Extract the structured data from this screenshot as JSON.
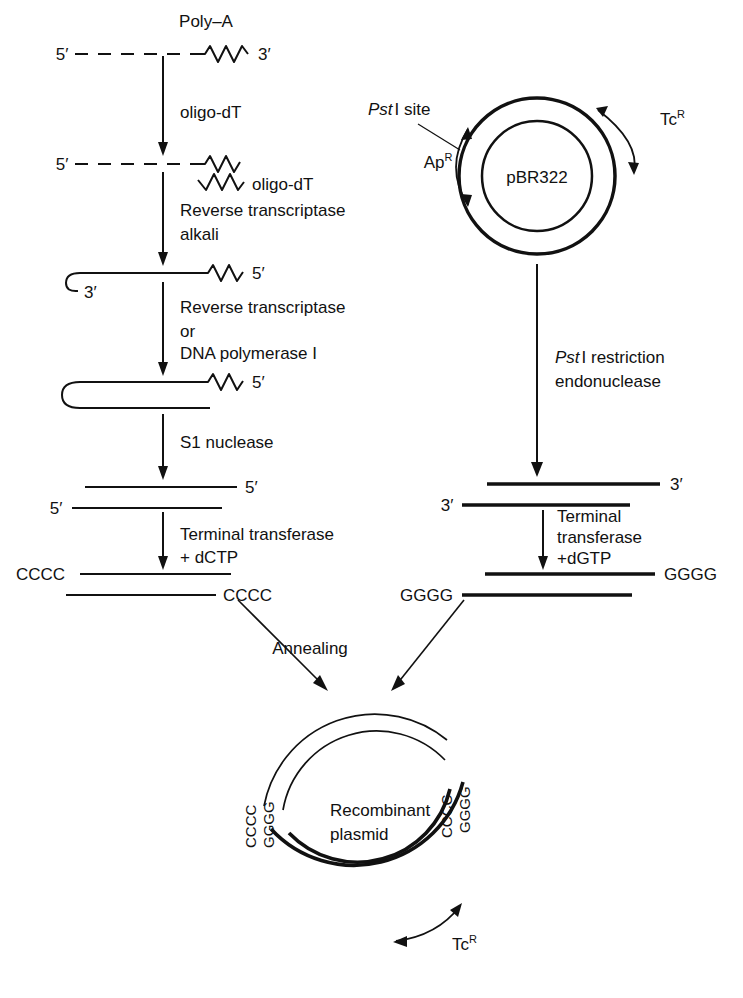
{
  "diagram": {
    "line_color": "#111111"
  },
  "left_pathway": {
    "name": "cDNA synthesis from mRNA",
    "step0": {
      "polya_label": "Poly–A",
      "five_prime": "5′",
      "three_prime": "3′"
    },
    "arrow1_label": "oligo-dT",
    "step1": {
      "five_prime": "5′",
      "oligo_dt_label": "oligo-dT"
    },
    "arrow2_label_line1": "Reverse transcriptase",
    "arrow2_label_line2": "alkali",
    "step2": {
      "three_prime": "3′",
      "five_prime": "5′"
    },
    "arrow3_label_line1": "Reverse transcriptase",
    "arrow3_label_line2": "or",
    "arrow3_label_line3": "DNA polymerase I",
    "step3": {
      "five_prime": "5′"
    },
    "arrow4_label": "S1 nuclease",
    "step4": {
      "top_five_prime": "5′",
      "bottom_five_prime": "5′"
    },
    "arrow5_label_line1": "Terminal transferase",
    "arrow5_label_line2": "+ dCTP",
    "step5": {
      "top_tail": "CCCC",
      "bottom_tail": "CCCC"
    }
  },
  "right_pathway": {
    "name": "pBR322 vector preparation",
    "plasmid": {
      "name": "pBR322",
      "pst_site_italic": "Pst",
      "pst_site_rest": "I site",
      "ap_label": "Ap",
      "ap_superscript": "R",
      "tc_label": "Tc",
      "tc_superscript": "R"
    },
    "arrow1_label_italic": "Pst",
    "arrow1_label_line1_rest": "I restriction",
    "arrow1_label_line2": "endonuclease",
    "step1": {
      "top_three_prime": "3′",
      "bottom_three_prime": "3′"
    },
    "arrow2_label_line1": "Terminal",
    "arrow2_label_line2": "transferase",
    "arrow2_label_line3": "+dGTP",
    "step2": {
      "top_tail": "GGGG",
      "bottom_tail": "GGGG"
    }
  },
  "annealing": {
    "label": "Annealing"
  },
  "product": {
    "title_line1": "Recombinant",
    "title_line2": "plasmid",
    "left_tail_outer": "CCCC",
    "left_tail_inner": "GGGG",
    "right_tail_outer": "GGGG",
    "right_tail_inner": "CCCC",
    "tc_label": "Tc",
    "tc_superscript": "R"
  }
}
